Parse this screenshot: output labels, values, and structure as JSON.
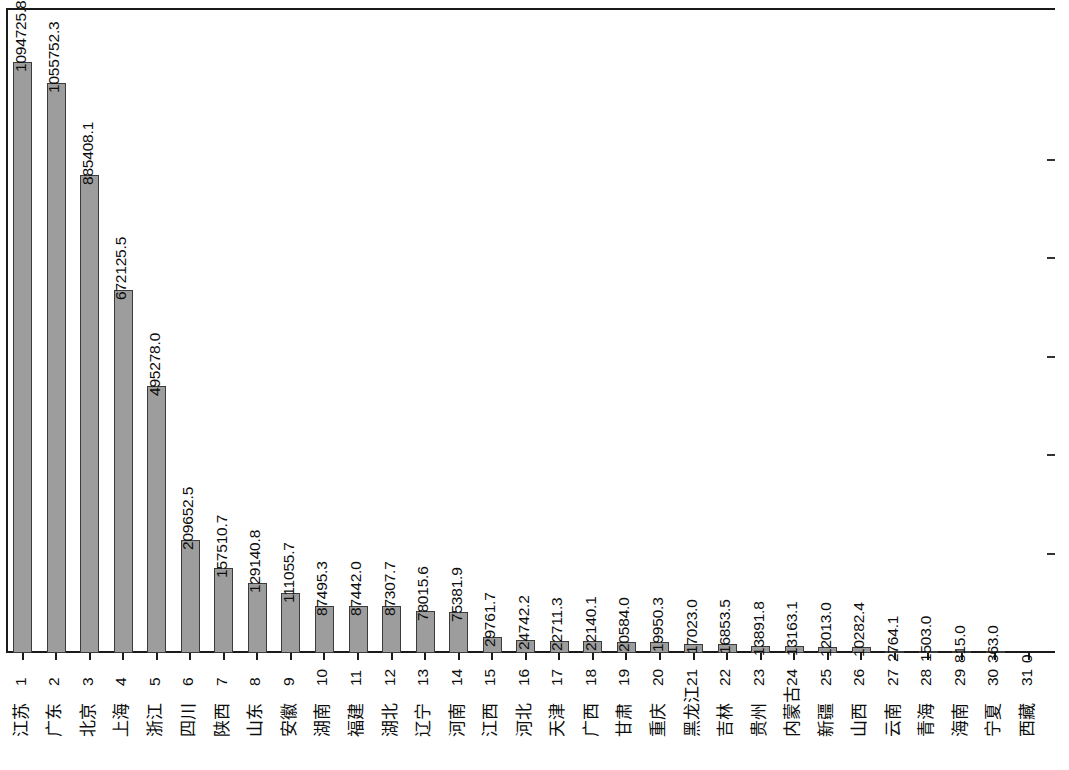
{
  "chart_data": {
    "type": "bar",
    "title": "",
    "subtitle": "",
    "xlabel": "",
    "ylabel": "",
    "orientation": "rotated-90ccw",
    "grid": false,
    "legend": null,
    "ylim": [
      0,
      1094725.8
    ],
    "value_axis_ticks_count": 5,
    "categories": [
      "江苏",
      "广东",
      "北京",
      "上海",
      "浙江",
      "四川",
      "陕西",
      "山东",
      "安徽",
      "湖南",
      "福建",
      "湖北",
      "辽宁",
      "河南",
      "江西",
      "河北",
      "天津",
      "广西",
      "甘肃",
      "重庆",
      "黑龙江",
      "吉林",
      "贵州",
      "内蒙古",
      "新疆",
      "山西",
      "云南",
      "青海",
      "海南",
      "宁夏",
      "西藏"
    ],
    "category_indices": [
      "1",
      "2",
      "3",
      "4",
      "5",
      "6",
      "7",
      "8",
      "9",
      "10",
      "11",
      "12",
      "13",
      "14",
      "15",
      "16",
      "17",
      "18",
      "19",
      "20",
      "21",
      "22",
      "23",
      "24",
      "25",
      "26",
      "27",
      "28",
      "29",
      "30",
      "31"
    ],
    "values": [
      1094725.8,
      1055752.3,
      885408.1,
      672125.5,
      495278.0,
      209652.5,
      157510.7,
      129140.8,
      111055.7,
      87495.3,
      87442.0,
      87307.7,
      78015.6,
      75381.9,
      29761.7,
      24742.2,
      22711.3,
      22140.1,
      20584.0,
      19950.3,
      17023.0,
      16853.5,
      13891.8,
      13163.1,
      12013.0,
      10282.4,
      2764.1,
      1503.0,
      815.0,
      363.0,
      0
    ],
    "value_labels": [
      "1094725.8",
      "1055752.3",
      "885408.1",
      "672125.5",
      "495278.0",
      "209652.5",
      "157510.7",
      "129140.8",
      "111055.7",
      "87495.3",
      "87442.0",
      "87307.7",
      "78015.6",
      "75381.9",
      "29761.7",
      "24742.2",
      "22711.3",
      "22140.1",
      "20584.0",
      "19950.3",
      "17023.0",
      "16853.5",
      "13891.8",
      "13163.1",
      "12013.0",
      "10282.4",
      "2764.1",
      "1503.0",
      "815.0",
      "363.0",
      "0"
    ],
    "bar_color": "#9d9d9d",
    "bar_edge_color": "#3b3b3b",
    "axis_color": "#1a1a1a",
    "text_color": "#0d0d0d"
  }
}
